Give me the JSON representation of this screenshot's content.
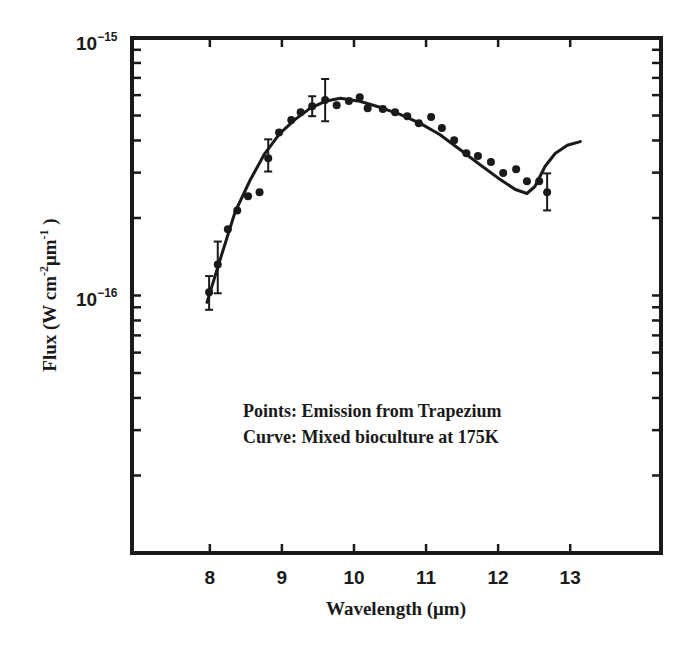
{
  "chart_data": {
    "type": "scatter",
    "title": "",
    "xlabel": "Wavelength (μm)",
    "ylabel": "Flux (W cm⁻² μm⁻¹)",
    "xlim": [
      6.92,
      14.26
    ],
    "ylim": [
      1e-17,
      1e-15
    ],
    "yscale": "log",
    "grid": false,
    "x_ticks": [
      8,
      9,
      10,
      11,
      12,
      13
    ],
    "x_tick_labels": [
      "8",
      "9",
      "10",
      "11",
      "12",
      "13"
    ],
    "y_tick_labels": [
      {
        "base": "10",
        "exp": "−15",
        "value": 1e-15
      },
      {
        "base": "10",
        "exp": "−16",
        "value": 1e-16
      }
    ],
    "legend": [],
    "annotations": [
      "Points: Emission from Trapezium",
      "Curve: Mixed bioculture at 175K"
    ],
    "series": [
      {
        "name": "Emission from Trapezium",
        "kind": "points",
        "x": [
          7.99,
          8.11,
          8.25,
          8.38,
          8.53,
          8.69,
          8.81,
          8.96,
          9.13,
          9.26,
          9.42,
          9.6,
          9.76,
          9.93,
          10.08,
          10.19,
          10.4,
          10.57,
          10.74,
          10.9,
          11.07,
          11.22,
          11.39,
          11.56,
          11.72,
          11.9,
          12.07,
          12.25,
          12.4,
          12.57,
          12.68
        ],
        "y": [
          1.03e-16,
          1.32e-16,
          1.81e-16,
          2.14e-16,
          2.43e-16,
          2.52e-16,
          3.41e-16,
          4.3e-16,
          4.8e-16,
          5.15e-16,
          5.43e-16,
          5.74e-16,
          5.48e-16,
          5.69e-16,
          5.89e-16,
          5.34e-16,
          5.3e-16,
          5.15e-16,
          4.97e-16,
          4.67e-16,
          4.93e-16,
          4.47e-16,
          4.01e-16,
          3.57e-16,
          3.48e-16,
          3.3e-16,
          2.99e-16,
          3.09e-16,
          2.78e-16,
          2.78e-16,
          2.52e-16
        ],
        "error_bars": [
          {
            "x": 7.99,
            "low": 8.8e-17,
            "high": 1.19e-16
          },
          {
            "x": 8.11,
            "low": 1.02e-16,
            "high": 1.62e-16
          },
          {
            "x": 8.81,
            "low": 3.03e-16,
            "high": 4.04e-16
          },
          {
            "x": 9.42,
            "low": 4.97e-16,
            "high": 5.94e-16
          },
          {
            "x": 9.6,
            "low": 4.75e-16,
            "high": 6.93e-16
          },
          {
            "x": 12.68,
            "low": 2.14e-16,
            "high": 2.98e-16
          }
        ]
      },
      {
        "name": "Mixed bioculture at 175K",
        "kind": "curve",
        "x": [
          7.96,
          8.14,
          8.35,
          8.56,
          8.76,
          8.97,
          9.18,
          9.39,
          9.6,
          9.81,
          10.08,
          10.36,
          10.64,
          10.92,
          11.19,
          11.47,
          11.75,
          12.03,
          12.24,
          12.4,
          12.51,
          12.65,
          12.79,
          12.96,
          13.14
        ],
        "y": [
          9.4e-17,
          1.37e-16,
          2.11e-16,
          2.81e-16,
          3.55e-16,
          4.25e-16,
          4.82e-16,
          5.33e-16,
          5.68e-16,
          5.83e-16,
          5.68e-16,
          5.38e-16,
          5.05e-16,
          4.66e-16,
          4.22e-16,
          3.69e-16,
          3.22e-16,
          2.82e-16,
          2.58e-16,
          2.49e-16,
          2.65e-16,
          3.17e-16,
          3.56e-16,
          3.83e-16,
          3.96e-16
        ]
      }
    ]
  },
  "labels": {
    "y_top_base": "10",
    "y_top_exp": "−15",
    "y_mid_base": "10",
    "y_mid_exp": "−16",
    "x_title": "Wavelength (μm)",
    "y_title_main": "Flux (W cm",
    "y_title_exp1": "-2",
    "y_title_mid": "μm",
    "y_title_exp2": "-1",
    "y_title_end": " )",
    "annot_line1": "Points: Emission from Trapezium",
    "annot_line2": "Curve: Mixed bioculture at 175K"
  }
}
